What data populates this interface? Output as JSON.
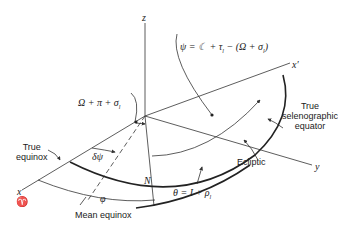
{
  "diagram": {
    "type": "selenographic coordinate geometry",
    "axes": {
      "z": "z",
      "x": "x",
      "x_symbol": "♈",
      "y": "y",
      "x_prime": "x′"
    },
    "labels": {
      "psi_formula": "ψ = ☾ + τ",
      "psi_formula_sub": "l",
      "psi_formula_rest": " − (Ω + σ",
      "psi_formula_sub2": "l",
      "psi_formula_end": ")",
      "omega_formula": "Ω + π + σ",
      "omega_formula_sub": "l",
      "true_selenographic_equator_line1": "True",
      "true_selenographic_equator_line2": "selenographic",
      "true_selenographic_equator_line3": "equator",
      "true_equinox_line1": "True",
      "true_equinox_line2": "equinox",
      "delta_psi": "δψ",
      "node": "N",
      "ecliptic": "Ecliptic",
      "theta_formula": "θ = I + ρ",
      "theta_formula_sub": "l",
      "phi": "φ",
      "mean_equinox": "Mean equinox"
    },
    "colors": {
      "line": "#333333",
      "thick_line": "#222222",
      "background": "#ffffff"
    }
  }
}
